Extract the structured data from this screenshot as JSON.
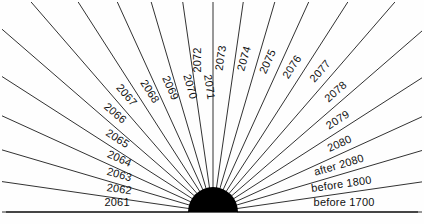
{
  "figure": {
    "name": "radial-fan-year-diagram",
    "width": 424,
    "height": 224,
    "background_color": "#fefefe",
    "line_color": "#1b1b1b",
    "hub_color": "#000000",
    "baseline_color": "#2a2a2a"
  },
  "hub": {
    "center_x": 213,
    "center_y": 212,
    "radius": 25
  },
  "chart_data": {
    "type": "pie",
    "title": "",
    "subtitle": "",
    "xlabel": "",
    "ylabel": "",
    "legend_position": "none",
    "grid": false,
    "layout": "semicircular fan of equal-angle spokes radiating from a filled black half-disc hub at bottom center; each spoke carries a rotated text label placed just above the line near its outer end",
    "angle_start_deg": 180,
    "angle_end_deg": 0,
    "spoke_count": 23,
    "categories": [
      "2061",
      "2062",
      "2063",
      "2064",
      "2065",
      "2066",
      "2067",
      "2068",
      "2069",
      "2070",
      "2071",
      "2072",
      "2073",
      "2074",
      "2075",
      "2076",
      "2077",
      "2078",
      "2079",
      "2080",
      "after 2080",
      "before 1800",
      "before 1700"
    ],
    "values": [
      1,
      1,
      1,
      1,
      1,
      1,
      1,
      1,
      1,
      1,
      1,
      1,
      1,
      1,
      1,
      1,
      1,
      1,
      1,
      1,
      1,
      1,
      1
    ]
  },
  "spokes": [
    {
      "label": "2061",
      "angle_deg": 180.0,
      "label_offset": 0.46
    },
    {
      "label": "2062",
      "angle_deg": 171.8,
      "label_offset": 0.46
    },
    {
      "label": "2063",
      "angle_deg": 163.6,
      "label_offset": 0.47
    },
    {
      "label": "2064",
      "angle_deg": 155.5,
      "label_offset": 0.48
    },
    {
      "label": "2065",
      "angle_deg": 147.3,
      "label_offset": 0.5
    },
    {
      "label": "2066",
      "angle_deg": 139.1,
      "label_offset": 0.52
    },
    {
      "label": "2067",
      "angle_deg": 130.9,
      "label_offset": 0.55
    },
    {
      "label": "2068",
      "angle_deg": 122.7,
      "label_offset": 0.58
    },
    {
      "label": "2069",
      "angle_deg": 114.5,
      "label_offset": 0.61
    },
    {
      "label": "2070",
      "angle_deg": 106.4,
      "label_offset": 0.63
    },
    {
      "label": "2071",
      "angle_deg": 98.2,
      "label_offset": 0.64
    },
    {
      "label": "2072",
      "angle_deg": 90.0,
      "label_offset": 0.64
    },
    {
      "label": "2073",
      "angle_deg": 81.8,
      "label_offset": 0.64
    },
    {
      "label": "2074",
      "angle_deg": 73.6,
      "label_offset": 0.63
    },
    {
      "label": "2075",
      "angle_deg": 65.5,
      "label_offset": 0.61
    },
    {
      "label": "2076",
      "angle_deg": 57.3,
      "label_offset": 0.58
    },
    {
      "label": "2077",
      "angle_deg": 49.1,
      "label_offset": 0.56
    },
    {
      "label": "2078",
      "angle_deg": 40.9,
      "label_offset": 0.54
    },
    {
      "label": "2079",
      "angle_deg": 32.7,
      "label_offset": 0.53
    },
    {
      "label": "2080",
      "angle_deg": 24.5,
      "label_offset": 0.52
    },
    {
      "label": "after 2080",
      "angle_deg": 16.4,
      "label_offset": 0.43
    },
    {
      "label": "before 1800",
      "angle_deg": 8.2,
      "label_offset": 0.4
    },
    {
      "label": "before 1700",
      "angle_deg": 0.0,
      "label_offset": 0.4
    }
  ],
  "baseline": {
    "name": "baseline-rule",
    "y": 212,
    "x_start": 6,
    "x_end": 418
  }
}
